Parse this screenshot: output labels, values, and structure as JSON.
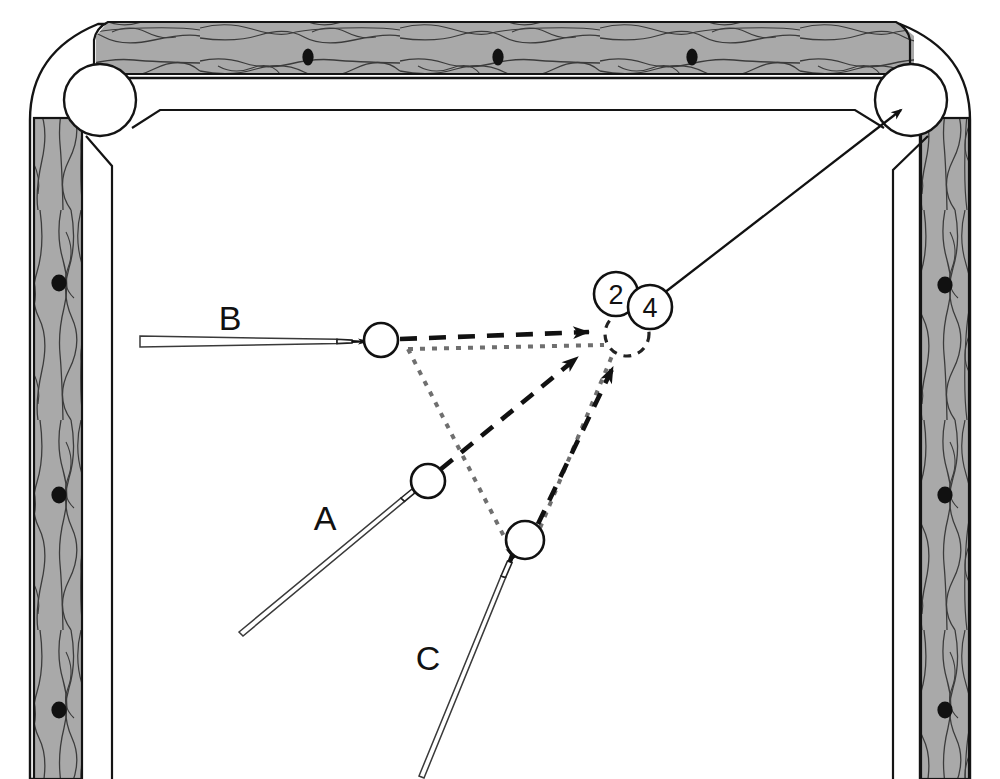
{
  "diagram": {
    "kind": "billiards-shot-diagram",
    "colors": {
      "rail_wood": "#a8a8a8",
      "rail_grain": "#3a3a3a",
      "cloth": "#ffffff",
      "line": "#1a1a1a",
      "ghost_line": "#6f6f6f",
      "diamond": "#111111"
    }
  },
  "table": {
    "rails": [
      {
        "name": "top-rail",
        "x": 108,
        "y": 22,
        "w": 790,
        "h": 52
      },
      {
        "name": "left-rail",
        "x": 30,
        "y": 60,
        "w": 52,
        "h": 719
      },
      {
        "name": "right-rail",
        "x": 920,
        "y": 60,
        "w": 52,
        "h": 719
      }
    ],
    "diamonds": {
      "top": [
        {
          "name": "diamond-top-1",
          "cx": 308,
          "cy": 57
        },
        {
          "name": "diamond-top-2",
          "cx": 498,
          "cy": 57
        },
        {
          "name": "diamond-top-3",
          "cx": 692,
          "cy": 57
        }
      ],
      "left": [
        {
          "name": "diamond-left-1",
          "cx": 59,
          "cy": 283
        },
        {
          "name": "diamond-left-2",
          "cx": 59,
          "cy": 495
        },
        {
          "name": "diamond-left-3",
          "cx": 59,
          "cy": 710
        }
      ],
      "right": [
        {
          "name": "diamond-right-1",
          "cx": 945,
          "cy": 285
        },
        {
          "name": "diamond-right-2",
          "cx": 945,
          "cy": 495
        },
        {
          "name": "diamond-right-3",
          "cx": 945,
          "cy": 710
        }
      ]
    },
    "pockets": [
      {
        "name": "pocket-top-left",
        "cx": 100,
        "cy": 100,
        "r": 36
      },
      {
        "name": "pocket-top-right",
        "cx": 911,
        "cy": 100,
        "r": 36
      }
    ]
  },
  "balls": [
    {
      "id": "A",
      "name": "cue-ball-a",
      "cx": 428,
      "cy": 481,
      "r": 17,
      "style": "solid"
    },
    {
      "id": "B",
      "name": "cue-ball-b",
      "cx": 381,
      "cy": 340,
      "r": 17,
      "style": "solid"
    },
    {
      "id": "C",
      "name": "cue-ball-c",
      "cx": 525,
      "cy": 540,
      "r": 19,
      "style": "solid"
    },
    {
      "id": "ghost",
      "name": "ghost-ball-target",
      "cx": 627,
      "cy": 334,
      "r": 22,
      "style": "dashed"
    }
  ],
  "object_balls": [
    {
      "number": "2",
      "name": "object-ball-2",
      "cx": 616,
      "cy": 294,
      "r": 22
    },
    {
      "number": "4",
      "name": "object-ball-4",
      "cx": 650,
      "cy": 307,
      "r": 22
    }
  ],
  "cues": [
    {
      "id": "A",
      "label": "A",
      "name": "cue-stick-a",
      "label_x": 325,
      "label_y": 530,
      "tip_x": 413,
      "tip_y": 494,
      "butt_x": 239,
      "butt_y": 628
    },
    {
      "id": "B",
      "label": "B",
      "name": "cue-stick-b",
      "label_x": 230,
      "label_y": 330,
      "tip_x": 363,
      "tip_y": 341,
      "butt_x": 140,
      "butt_y": 343
    },
    {
      "id": "C",
      "label": "C",
      "name": "cue-stick-c",
      "label_x": 428,
      "label_y": 670,
      "tip_x": 513,
      "tip_y": 557,
      "butt_x": 424,
      "butt_y": 776
    }
  ],
  "aim_lines": [
    {
      "id": "B-aim",
      "name": "aim-line-b",
      "from": "B",
      "x1": 400,
      "y1": 339,
      "x2": 601,
      "y2": 331,
      "style": "dash-long",
      "arrow": true
    },
    {
      "id": "A-aim",
      "name": "aim-line-a",
      "from": "A",
      "x1": 441,
      "y1": 469,
      "x2": 592,
      "y2": 350,
      "style": "dash-long",
      "arrow": true
    },
    {
      "id": "C-aim",
      "name": "aim-line-c",
      "from": "C",
      "x1": 538,
      "y1": 524,
      "x2": 617,
      "y2": 358,
      "style": "dash-long",
      "arrow": true
    }
  ],
  "ghost_lines": [
    {
      "id": "ghost-top",
      "name": "ghost-line-top",
      "x1": 408,
      "y1": 349,
      "x2": 604,
      "y2": 345,
      "style": "dot-fine"
    },
    {
      "id": "ghost-left",
      "name": "ghost-line-left",
      "x1": 408,
      "y1": 349,
      "x2": 512,
      "y2": 552,
      "style": "dot-fine"
    },
    {
      "id": "ghost-right",
      "name": "ghost-line-right",
      "x1": 540,
      "y1": 528,
      "x2": 612,
      "y2": 356,
      "style": "dot-fine"
    }
  ],
  "pot_line": {
    "name": "pot-line-to-pocket",
    "x1": 664,
    "y1": 293,
    "x2": 899,
    "y2": 112,
    "style": "solid",
    "arrow": true
  },
  "labels": {
    "a": "A",
    "b": "B",
    "c": "C",
    "ball_two": "2",
    "ball_four": "4"
  }
}
